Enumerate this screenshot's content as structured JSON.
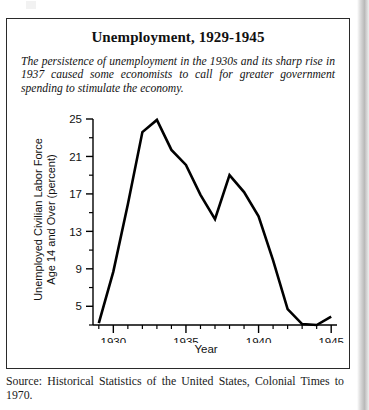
{
  "figure": {
    "title": "Unemployment, 1929-1945",
    "caption": "The persistence of unemployment in the 1930s and its sharp rise in 1937 caused some economists to call for greater government spending to stimulate the economy.",
    "source": "Source: Historical Statistics of the United States, Colonial Times to 1970."
  },
  "chart_data": {
    "type": "line",
    "title": "Unemployment, 1929-1945",
    "xlabel": "Year",
    "ylabel": "Unemployed Civilian Labor Force\nAge 14 and Over (percent)",
    "ylabel_line1": "Unemployed Civilian Labor Force",
    "ylabel_line2": "Age 14 and Over (percent)",
    "xlim": [
      1928.6,
      1945.4
    ],
    "ylim": [
      3.0,
      25.0
    ],
    "grid": false,
    "legend": false,
    "y_major_ticks": [
      5,
      9,
      13,
      17,
      21,
      25
    ],
    "y_minor_ticks": [
      3,
      7,
      11,
      15,
      19,
      23
    ],
    "y_tick_labels": [
      "5",
      "9",
      "13",
      "17",
      "21",
      "25"
    ],
    "x_major_ticks": [
      1930,
      1935,
      1940,
      1945
    ],
    "x_tick_labels": [
      "1930",
      "1935",
      "1940",
      "1945"
    ],
    "x_minor_ticks": [
      1929,
      1931,
      1932,
      1933,
      1934,
      1936,
      1937,
      1938,
      1939,
      1941,
      1942,
      1943,
      1944
    ],
    "line_color": "#000000",
    "line_width": 2.6,
    "x": [
      1929,
      1930,
      1931,
      1932,
      1933,
      1934,
      1935,
      1936,
      1937,
      1938,
      1939,
      1940,
      1941,
      1942,
      1943,
      1944,
      1945
    ],
    "values": [
      3.2,
      8.7,
      15.9,
      23.6,
      24.9,
      21.7,
      20.1,
      16.9,
      14.3,
      19.0,
      17.2,
      14.6,
      9.9,
      4.7,
      3.1,
      3.0,
      3.9
    ],
    "series": [
      {
        "name": "Unemployment rate (percent)",
        "values": [
          3.2,
          8.7,
          15.9,
          23.6,
          24.9,
          21.7,
          20.1,
          16.9,
          14.3,
          19.0,
          17.2,
          14.6,
          9.9,
          4.7,
          3.1,
          3.0,
          3.9
        ]
      }
    ]
  }
}
